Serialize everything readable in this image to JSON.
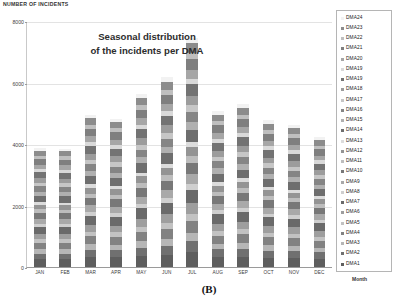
{
  "axis": {
    "y_title": "NUMBER OF INCIDENTS",
    "x_title": "Month"
  },
  "annotation": {
    "line1": "Seasonal distribution",
    "line2": "of  the incidents per DMA"
  },
  "caption": "(B)",
  "legend": {
    "items": [
      {
        "label": "DMA24",
        "color": "#f2f2f2"
      },
      {
        "label": "DMA23",
        "color": "#8c8c8c"
      },
      {
        "label": "DMA22",
        "color": "#bfbfbf"
      },
      {
        "label": "DMA21",
        "color": "#7f7f7f"
      },
      {
        "label": "DMA20",
        "color": "#a6a6a6"
      },
      {
        "label": "DMA19",
        "color": "#d9d9d9"
      },
      {
        "label": "DMA19",
        "color": "#737373"
      },
      {
        "label": "DMA18",
        "color": "#9c9c9c"
      },
      {
        "label": "DMA17",
        "color": "#c6c6c6"
      },
      {
        "label": "DMA16",
        "color": "#858585"
      },
      {
        "label": "DMA15",
        "color": "#b0b0b0"
      },
      {
        "label": "DMA14",
        "color": "#6e6e6e"
      },
      {
        "label": "DMA13",
        "color": "#dcdcdc"
      },
      {
        "label": "DMA12",
        "color": "#949494"
      },
      {
        "label": "DMA11",
        "color": "#bdbdbd"
      },
      {
        "label": "DMA10",
        "color": "#787878"
      },
      {
        "label": "DMA9",
        "color": "#a9a9a9"
      },
      {
        "label": "DMA8",
        "color": "#cfcfcf"
      },
      {
        "label": "DMA7",
        "color": "#6a6a6a"
      },
      {
        "label": "DMA6",
        "color": "#9e9e9e"
      },
      {
        "label": "DMA5",
        "color": "#c2c2c2"
      },
      {
        "label": "DMA4",
        "color": "#828282"
      },
      {
        "label": "DMA3",
        "color": "#b6b6b6"
      },
      {
        "label": "DMA2",
        "color": "#707070"
      },
      {
        "label": "DMA1",
        "color": "#5e5e5e"
      }
    ]
  },
  "chart_data": {
    "type": "bar",
    "stacked": true,
    "title": "Seasonal distribution of  the incidents per DMA",
    "xlabel": "Month",
    "ylabel": "NUMBER OF INCIDENTS",
    "ylim": [
      0,
      8000
    ],
    "yticks": [
      0,
      2000,
      4000,
      6000,
      8000
    ],
    "grid": true,
    "legend_position": "right",
    "categories": [
      "JAN",
      "FEB",
      "MAR",
      "APR",
      "MAY",
      "JUN",
      "JUL",
      "AUG",
      "SEP",
      "OCT",
      "NOV",
      "DEC"
    ],
    "totals": [
      3880,
      3860,
      4950,
      4830,
      5650,
      6180,
      7450,
      5080,
      5300,
      4780,
      4620,
      4220
    ],
    "series": [
      {
        "name": "DMA1",
        "color": "#5e5e5e",
        "values": [
          250,
          248,
          318,
          310,
          362,
          396,
          478,
          326,
          340,
          307,
          296,
          271
        ]
      },
      {
        "name": "DMA2",
        "color": "#707070",
        "values": [
          186,
          185,
          238,
          232,
          271,
          297,
          358,
          244,
          254,
          229,
          222,
          203
        ]
      },
      {
        "name": "DMA3",
        "color": "#b6b6b6",
        "values": [
          143,
          142,
          182,
          178,
          208,
          227,
          274,
          187,
          195,
          176,
          170,
          155
        ]
      },
      {
        "name": "DMA4",
        "color": "#828282",
        "values": [
          205,
          204,
          261,
          255,
          298,
          326,
          393,
          268,
          280,
          252,
          244,
          223
        ]
      },
      {
        "name": "DMA5",
        "color": "#c2c2c2",
        "values": [
          120,
          119,
          153,
          150,
          175,
          191,
          231,
          157,
          164,
          148,
          143,
          131
        ]
      },
      {
        "name": "DMA6",
        "color": "#9e9e9e",
        "values": [
          178,
          177,
          227,
          222,
          259,
          284,
          342,
          233,
          243,
          219,
          212,
          194
        ]
      },
      {
        "name": "DMA7",
        "color": "#6a6a6a",
        "values": [
          232,
          231,
          296,
          289,
          338,
          370,
          446,
          304,
          317,
          286,
          277,
          253
        ]
      },
      {
        "name": "DMA8",
        "color": "#cfcfcf",
        "values": [
          97,
          96,
          124,
          121,
          141,
          155,
          186,
          127,
          133,
          120,
          116,
          106
        ]
      },
      {
        "name": "DMA9",
        "color": "#a9a9a9",
        "values": [
          162,
          161,
          207,
          202,
          236,
          258,
          311,
          212,
          221,
          200,
          193,
          176
        ]
      },
      {
        "name": "DMA10",
        "color": "#787878",
        "values": [
          194,
          193,
          248,
          242,
          283,
          310,
          373,
          254,
          265,
          239,
          231,
          211
        ]
      },
      {
        "name": "DMA11",
        "color": "#bdbdbd",
        "values": [
          108,
          107,
          138,
          135,
          157,
          172,
          207,
          141,
          148,
          133,
          129,
          118
        ]
      },
      {
        "name": "DMA12",
        "color": "#949494",
        "values": [
          151,
          150,
          193,
          188,
          220,
          240,
          290,
          198,
          206,
          186,
          180,
          164
        ]
      },
      {
        "name": "DMA13",
        "color": "#dcdcdc",
        "values": [
          85,
          85,
          109,
          106,
          124,
          136,
          164,
          112,
          117,
          105,
          102,
          93
        ]
      },
      {
        "name": "DMA14",
        "color": "#6e6e6e",
        "values": [
          213,
          212,
          272,
          265,
          310,
          339,
          409,
          279,
          291,
          262,
          254,
          232
        ]
      },
      {
        "name": "DMA15",
        "color": "#b0b0b0",
        "values": [
          132,
          131,
          168,
          164,
          192,
          210,
          253,
          173,
          180,
          163,
          157,
          144
        ]
      },
      {
        "name": "DMA16",
        "color": "#858585",
        "values": [
          170,
          169,
          217,
          212,
          248,
          271,
          327,
          223,
          233,
          210,
          203,
          185
        ]
      },
      {
        "name": "DMA17",
        "color": "#c6c6c6",
        "values": [
          112,
          111,
          143,
          139,
          163,
          178,
          215,
          146,
          153,
          138,
          133,
          122
        ]
      },
      {
        "name": "DMA18",
        "color": "#9c9c9c",
        "values": [
          155,
          154,
          198,
          193,
          225,
          246,
          297,
          203,
          211,
          190,
          184,
          168
        ]
      },
      {
        "name": "DMA19",
        "color": "#737373",
        "values": [
          201,
          200,
          256,
          250,
          292,
          320,
          386,
          263,
          275,
          248,
          239,
          219
        ]
      },
      {
        "name": "DMA19b",
        "color": "#d9d9d9",
        "values": [
          93,
          92,
          118,
          115,
          135,
          147,
          178,
          121,
          127,
          114,
          110,
          101
        ]
      },
      {
        "name": "DMA20",
        "color": "#a6a6a6",
        "values": [
          147,
          146,
          187,
          183,
          213,
          234,
          282,
          192,
          200,
          181,
          175,
          159
        ]
      },
      {
        "name": "DMA21",
        "color": "#7f7f7f",
        "values": [
          189,
          188,
          241,
          235,
          275,
          301,
          363,
          247,
          258,
          233,
          225,
          206
        ]
      },
      {
        "name": "DMA22",
        "color": "#bfbfbf",
        "values": [
          104,
          103,
          132,
          129,
          151,
          165,
          199,
          136,
          142,
          128,
          124,
          113
        ]
      },
      {
        "name": "DMA23",
        "color": "#8c8c8c",
        "values": [
          166,
          165,
          212,
          207,
          242,
          264,
          319,
          218,
          227,
          205,
          198,
          181
        ]
      },
      {
        "name": "DMA24",
        "color": "#f2f2f2",
        "values": [
          87,
          86,
          111,
          108,
          126,
          138,
          167,
          114,
          119,
          107,
          104,
          95
        ]
      }
    ]
  }
}
